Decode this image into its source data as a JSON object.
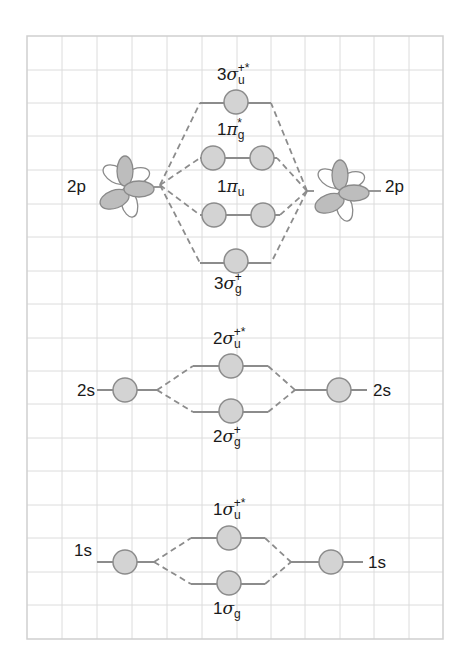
{
  "diagram": {
    "type": "molecular-orbital-energy-diagram",
    "colors": {
      "grid": "#d9d9d9",
      "grid_border": "#cfcfcf",
      "level_line": "#8c8c8c",
      "dash_line": "#8c8c8c",
      "orbital_fill": "#d3d3d3",
      "orbital_stroke": "#8c8c8c",
      "lobe_fill": "#bdbdbd",
      "lobe_stroke": "#8a8a8a",
      "text": "#1a1a1a"
    },
    "grid": {
      "left": 27,
      "top": 36,
      "right": 443,
      "bottom": 639,
      "cols": 12,
      "rows": 18
    },
    "atomic_orbitals": {
      "2p_left": {
        "label": "2p"
      },
      "2p_right": {
        "label": "2p"
      },
      "2s_left": {
        "label": "2s"
      },
      "2s_right": {
        "label": "2s"
      },
      "1s_left": {
        "label": "1s"
      },
      "1s_right": {
        "label": "1s"
      }
    },
    "molecular_orbitals": {
      "sigma3u": {
        "prefix": "3",
        "symbol": "σ",
        "sub": "u",
        "sup": "+*"
      },
      "pi1g": {
        "prefix": "1",
        "symbol": "π",
        "sub": "g",
        "sup": "*"
      },
      "pi1u": {
        "prefix": "1",
        "symbol": "π",
        "sub": "u",
        "sup": ""
      },
      "sigma3g": {
        "prefix": "3",
        "symbol": "σ",
        "sub": "g",
        "sup": "+"
      },
      "sigma2u": {
        "prefix": "2",
        "symbol": "σ",
        "sub": "u",
        "sup": "+*"
      },
      "sigma2g": {
        "prefix": "2",
        "symbol": "σ",
        "sub": "g",
        "sup": "+"
      },
      "sigma1u": {
        "prefix": "1",
        "symbol": "σ",
        "sub": "u",
        "sup": "+*"
      },
      "sigma1g": {
        "prefix": "1",
        "symbol": "σ",
        "sub": "g",
        "sup": ""
      }
    }
  }
}
